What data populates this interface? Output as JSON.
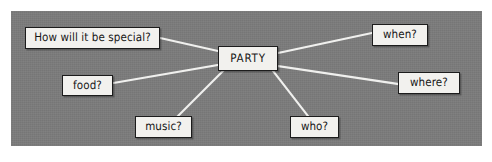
{
  "figure": {
    "kind": "mind-map",
    "topic": "PARTY",
    "canvas_color": "#7b7b7b",
    "node_fill_color": "#f2f1ee",
    "node_border_color": "#1c1c1c",
    "connector_color": "#f0f0ee",
    "page_background": "#ffffff"
  },
  "center_node": {
    "id": "party",
    "label": "PARTY"
  },
  "branch_nodes": [
    {
      "id": "special",
      "label": "How will it be special?"
    },
    {
      "id": "food",
      "label": "food?"
    },
    {
      "id": "music",
      "label": "music?"
    },
    {
      "id": "who",
      "label": "who?"
    },
    {
      "id": "when",
      "label": "when?"
    },
    {
      "id": "where",
      "label": "where?"
    }
  ],
  "connectors": [
    {
      "from": "party",
      "to": "special"
    },
    {
      "from": "party",
      "to": "food"
    },
    {
      "from": "party",
      "to": "music"
    },
    {
      "from": "party",
      "to": "who"
    },
    {
      "from": "party",
      "to": "when"
    },
    {
      "from": "party",
      "to": "where"
    }
  ]
}
